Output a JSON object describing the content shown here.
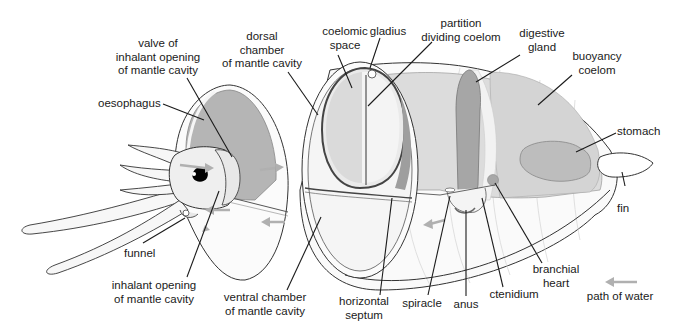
{
  "colors": {
    "outline": "#333333",
    "body_light": "#f2f2f2",
    "body_mid": "#d9d9d9",
    "organ_dark": "#a8a8a8",
    "organ_mid": "#c4c4c4",
    "water_arrow": "#b0b0b0",
    "eye": "#000000"
  },
  "labels": {
    "valve": [
      "valve of",
      "inhalant opening",
      "of mantle cavity"
    ],
    "oesophagus": [
      "oesophagus"
    ],
    "dorsal_chamber": [
      "dorsal",
      "chamber",
      "of mantle cavity"
    ],
    "coelomic_space": [
      "coelomic",
      "space"
    ],
    "gladius": [
      "gladius"
    ],
    "partition": [
      "partition",
      "dividing coelom"
    ],
    "digestive_gland": [
      "digestive",
      "gland"
    ],
    "buoyancy_coelom": [
      "buoyancy",
      "coelom"
    ],
    "stomach": [
      "stomach"
    ],
    "fin": [
      "fin"
    ],
    "funnel": [
      "funnel"
    ],
    "inhalant_opening": [
      "inhalant opening",
      "of mantle cavity"
    ],
    "ventral_chamber": [
      "ventral chamber",
      "of mantle cavity"
    ],
    "horizontal_septum": [
      "horizontal",
      "septum"
    ],
    "spiracle": [
      "spiracle"
    ],
    "anus": [
      "anus"
    ],
    "ctenidium": [
      "ctenidium"
    ],
    "branchial_heart": [
      "branchial",
      "heart"
    ]
  },
  "legend": {
    "arrow_label": "path of water"
  }
}
